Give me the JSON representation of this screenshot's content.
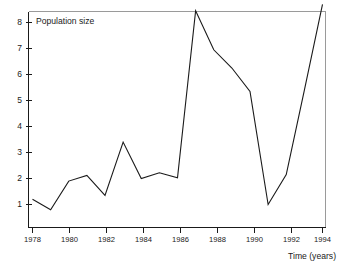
{
  "chart_data": {
    "type": "line",
    "title": "",
    "annotation": "Population size",
    "xlabel": "Time (years)",
    "ylabel": "",
    "xlim": [
      1977.6,
      1994.4
    ],
    "ylim": [
      0.45,
      8.95
    ],
    "grid": false,
    "legend": "none",
    "x_ticks": [
      1978,
      1980,
      1982,
      1984,
      1986,
      1988,
      1990,
      1992,
      1994
    ],
    "x_tick_labels": [
      "1978",
      "1980",
      "1982",
      "1984",
      "1986",
      "1988",
      "1990",
      "1992",
      "1994"
    ],
    "y_ticks": [
      1,
      2,
      3,
      4,
      5,
      6,
      7,
      8
    ],
    "y_tick_labels": [
      "1",
      "2",
      "3",
      "4",
      "5",
      "6",
      "7",
      "8"
    ],
    "x": [
      1978,
      1979,
      1980,
      1981,
      1982,
      1983,
      1984,
      1985,
      1986,
      1987,
      1988,
      1989,
      1990,
      1991,
      1992,
      1993,
      1994
    ],
    "values": [
      1.2,
      0.8,
      1.9,
      2.12,
      1.35,
      3.4,
      2.0,
      2.22,
      2.03,
      8.45,
      6.95,
      6.25,
      5.35,
      1.0,
      2.15,
      5.4,
      8.7
    ],
    "series": [
      {
        "name": "Population size",
        "color": "#1a1a1a",
        "values": [
          1.2,
          0.8,
          1.9,
          2.12,
          1.35,
          3.4,
          2.0,
          2.22,
          2.03,
          8.45,
          6.95,
          6.25,
          5.35,
          1.0,
          2.15,
          5.4,
          8.7
        ]
      }
    ]
  },
  "figure": {
    "frame_color": "#9a9a9a",
    "axis_color": "#1a1a1a",
    "background": "#ffffff"
  }
}
